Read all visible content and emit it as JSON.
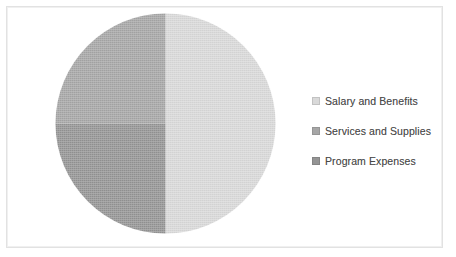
{
  "chart_data": {
    "type": "pie",
    "title": "",
    "subtitle": "",
    "xlabel": "",
    "ylabel": "",
    "grid": false,
    "legend_position": "right",
    "categories": [
      "Salary and Benefits",
      "Services and Supplies",
      "Program Expenses"
    ],
    "values": [
      50,
      25,
      25
    ],
    "units": "percent",
    "start_angle_deg": 0,
    "direction": "clockwise",
    "slices": [
      {
        "label": "Salary and Benefits",
        "value": 50,
        "percent": 50,
        "color": "#d9d9d9",
        "start_angle_deg": 0,
        "end_angle_deg": 180
      },
      {
        "label": "Services and Supplies",
        "value": 25,
        "percent": 25,
        "color": "#a6a6a6",
        "start_angle_deg": 270,
        "end_angle_deg": 360
      },
      {
        "label": "Program Expenses",
        "value": 25,
        "percent": 25,
        "color": "#949494",
        "start_angle_deg": 180,
        "end_angle_deg": 270
      }
    ]
  },
  "legend": {
    "items": [
      {
        "label": "Salary and Benefits",
        "color": "#d9d9d9",
        "marker": "square-swatch-icon"
      },
      {
        "label": "Services and Supplies",
        "color": "#a6a6a6",
        "marker": "square-swatch-icon"
      },
      {
        "label": "Program Expenses",
        "color": "#949494",
        "marker": "square-swatch-icon"
      }
    ]
  },
  "colors": {
    "background": "#ffffff",
    "frame_border": "#e2e2e2",
    "text": "#4a4a4a",
    "slice_light": "#d9d9d9",
    "slice_medium": "#a6a6a6",
    "slice_dark": "#949494"
  }
}
